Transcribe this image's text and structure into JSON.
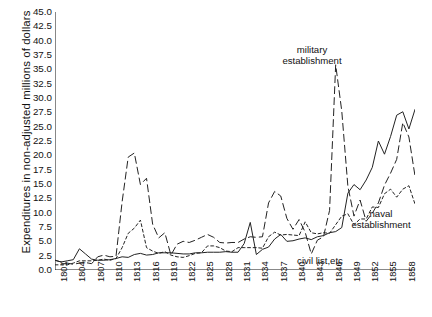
{
  "chart_data": {
    "type": "line",
    "title": "",
    "xlabel": "",
    "ylabel": "Expenditures in non-adjusted millions of dollars",
    "xlim": [
      1801,
      1860
    ],
    "ylim": [
      0.0,
      45.0
    ],
    "ytick_step": 2.5,
    "grid": false,
    "legend_position": "inline-annotations",
    "x": [
      1801,
      1802,
      1803,
      1804,
      1805,
      1806,
      1807,
      1808,
      1809,
      1810,
      1811,
      1812,
      1813,
      1814,
      1815,
      1816,
      1817,
      1818,
      1819,
      1820,
      1821,
      1822,
      1823,
      1824,
      1825,
      1826,
      1827,
      1828,
      1829,
      1830,
      1831,
      1832,
      1833,
      1834,
      1835,
      1836,
      1837,
      1838,
      1839,
      1840,
      1841,
      1842,
      1843,
      1844,
      1845,
      1846,
      1847,
      1848,
      1849,
      1850,
      1851,
      1852,
      1853,
      1854,
      1855,
      1856,
      1857,
      1858,
      1859,
      1860
    ],
    "ytick_labels": [
      "0.0",
      "2.5",
      "5.0",
      "7.5",
      "10.0",
      "12.5",
      "15.0",
      "17.5",
      "20.0",
      "22.5",
      "25.0",
      "27.5",
      "30.0",
      "32.5",
      "35.0",
      "37.5",
      "40.0",
      "42.5",
      "45.0"
    ],
    "xtick_labels": [
      "1801",
      "1804",
      "1807",
      "1810",
      "1813",
      "1816",
      "1819",
      "1822",
      "1825",
      "1828",
      "1831",
      "1834",
      "1837",
      "1840",
      "1843",
      "1846",
      "1849",
      "1852",
      "1855",
      "1858"
    ],
    "series": [
      {
        "name": "military establishment",
        "style": "long-dash",
        "color": "#222222",
        "label_text_line1": "military",
        "label_text_line2": "establishment",
        "values": [
          1.7,
          1.4,
          1.2,
          1.0,
          1.2,
          1.3,
          1.1,
          2.3,
          2.6,
          2.3,
          2.4,
          11.9,
          19.7,
          20.4,
          14.9,
          16.0,
          8.0,
          5.6,
          6.5,
          2.6,
          4.5,
          5.0,
          4.8,
          5.2,
          5.7,
          6.2,
          5.7,
          4.8,
          4.7,
          4.8,
          4.8,
          5.4,
          5.8,
          5.7,
          5.8,
          11.7,
          13.7,
          12.9,
          9.0,
          7.1,
          8.8,
          6.6,
          2.8,
          5.2,
          5.8,
          10.4,
          35.8,
          27.7,
          14.6,
          9.4,
          12.2,
          8.5,
          9.9,
          11.7,
          14.8,
          16.9,
          19.3,
          25.7,
          23.2,
          16.4
        ]
      },
      {
        "name": "naval establishment",
        "style": "short-dash",
        "color": "#222222",
        "label_text_line1": "naval",
        "label_text_line2": "establishment",
        "values": [
          0.9,
          0.9,
          0.9,
          1.2,
          1.6,
          1.6,
          1.6,
          1.7,
          1.9,
          1.7,
          2.0,
          3.9,
          6.4,
          7.3,
          8.7,
          3.9,
          3.3,
          2.9,
          3.2,
          2.6,
          2.3,
          2.2,
          2.5,
          2.9,
          3.0,
          4.2,
          4.2,
          3.9,
          3.3,
          3.2,
          3.9,
          3.9,
          3.9,
          3.9,
          3.8,
          5.8,
          6.6,
          6.1,
          6.2,
          6.1,
          6.0,
          8.4,
          6.5,
          6.3,
          6.5,
          6.4,
          7.9,
          9.4,
          9.8,
          7.9,
          8.9,
          8.9,
          11.0,
          10.9,
          13.3,
          14.1,
          12.7,
          14.1,
          14.7,
          11.5
        ]
      },
      {
        "name": "civil list,etc",
        "style": "solid",
        "color": "#222222",
        "label_text_line1": "civil list,etc",
        "label_text_line2": "",
        "values": [
          1.7,
          1.4,
          1.6,
          1.8,
          3.7,
          2.8,
          1.9,
          1.7,
          1.7,
          1.8,
          2.0,
          2.3,
          2.2,
          2.7,
          2.9,
          2.6,
          2.7,
          3.0,
          3.0,
          3.0,
          2.9,
          2.8,
          2.8,
          3.0,
          3.0,
          3.1,
          3.1,
          3.1,
          3.2,
          3.1,
          3.1,
          4.6,
          8.3,
          2.7,
          3.6,
          4.0,
          5.4,
          6.2,
          5.0,
          5.1,
          5.4,
          5.6,
          5.3,
          5.8,
          6.0,
          6.5,
          6.7,
          7.4,
          13.4,
          14.9,
          14.0,
          15.7,
          17.9,
          22.5,
          20.2,
          23.3,
          27.0,
          27.6,
          24.6,
          28.0
        ]
      }
    ],
    "annotations": [
      {
        "name": "military-annotation",
        "text": "military establishment",
        "x_px": 312,
        "y_px": 44
      },
      {
        "name": "naval-annotation",
        "text": "naval establishment",
        "x_px": 381,
        "y_px": 208
      },
      {
        "name": "civil-annotation",
        "text": "civil list,etc",
        "x_px": 320,
        "y_px": 255
      }
    ]
  },
  "axes": {
    "y_label": "Expenditures in non-adjusted millions of dollars"
  },
  "labels": {
    "military_line1": "military",
    "military_line2": "establishment",
    "naval_line1": "naval",
    "naval_line2": "establishment",
    "civil": "civil list,etc"
  }
}
